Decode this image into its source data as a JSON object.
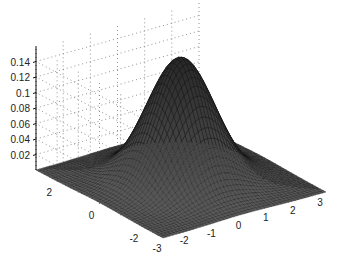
{
  "chart_data": {
    "type": "surface3d",
    "title": "",
    "function": "bivariate standard normal density z = exp(-(x^2+y^2)/2) / (2*pi)",
    "x": {
      "label": "",
      "range": [
        -3,
        3
      ],
      "ticks": [
        -3,
        -2,
        -1,
        0,
        1,
        2,
        3
      ]
    },
    "y": {
      "label": "",
      "range": [
        -3,
        3
      ],
      "ticks": [
        -2,
        0,
        2
      ]
    },
    "z": {
      "label": "",
      "range": [
        0,
        0.16
      ],
      "ticks": [
        0.02,
        0.04,
        0.06,
        0.08,
        0.1,
        0.12,
        0.14
      ]
    },
    "z_tick_labels": [
      "0.02",
      "0.04",
      "0.06",
      "0.08",
      "0.1",
      "0.12",
      "0.14"
    ],
    "x_tick_labels": [
      "-3",
      "-2",
      "-1",
      "0",
      "1",
      "2",
      "3"
    ],
    "y_tick_labels": [
      "-2",
      "0",
      "2"
    ],
    "peak": {
      "x": 0,
      "y": 0,
      "z": 0.159
    },
    "grid": true,
    "grid_style": "dotted",
    "mesh_resolution": 49,
    "colors": {
      "surface": "#2a2a2a",
      "mesh": "#111111",
      "grid": "#777777",
      "background": "#ffffff"
    }
  }
}
